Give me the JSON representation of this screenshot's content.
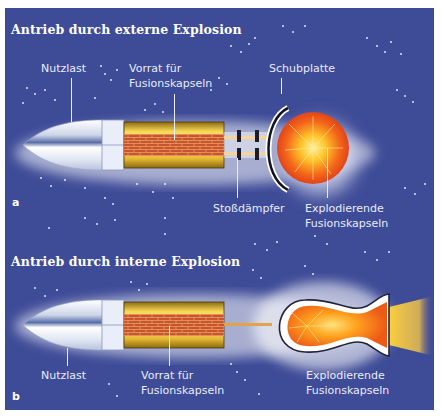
{
  "figure": {
    "background_color": "#3e4b97",
    "panels": [
      {
        "id": "a",
        "letter": "a",
        "title": "Antrieb durch externe Explosion",
        "labels": {
          "payload": "Nutzlast",
          "supply_line1": "Vorrat für",
          "supply_line2": "Fusionskapseln",
          "pusher_plate": "Schubplatte",
          "shock_absorber": "Stoßdämpfer",
          "exploding_line1": "Explodierende",
          "exploding_line2": "Fusionskapseln"
        }
      },
      {
        "id": "b",
        "letter": "b",
        "title": "Antrieb durch interne Explosion",
        "labels": {
          "payload": "Nutzlast",
          "supply_line1": "Vorrat für",
          "supply_line2": "Fusionskapseln",
          "exploding_line1": "Explodierende",
          "exploding_line2": "Fusionskapseln"
        }
      }
    ],
    "colors": {
      "nose_cone": "#f4f6fb",
      "fuel_tank_yellow": "#e9c43a",
      "brick": "#c8562a",
      "explosion_core": "#ffd23a",
      "explosion_outer": "#f05a14",
      "glow": "#ffffff"
    }
  }
}
